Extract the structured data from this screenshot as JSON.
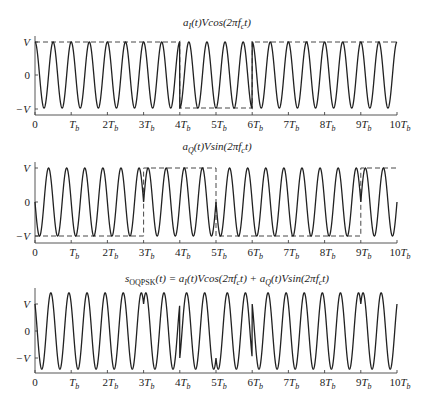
{
  "figure": {
    "panels": [
      {
        "id": "i-channel",
        "title_parts": [
          "a",
          "I",
          "(t)Vcos(2πf",
          "c",
          "t)"
        ],
        "title_text": "a_I(t)Vcos(2πf_c t)",
        "y_labels": [
          "V",
          "0",
          "−V"
        ]
      },
      {
        "id": "q-channel",
        "title_parts": [
          "a",
          "Q",
          "(t)Vsin(2πf",
          "c",
          "t)"
        ],
        "title_text": "a_Q(t)Vsin(2πf_c t)",
        "y_labels": [
          "V",
          "0",
          "−V"
        ]
      },
      {
        "id": "oqpsk-sum",
        "title_parts": [
          "s",
          "OQPSK",
          "(t) = a",
          "I",
          "(t)Vcos(2πf",
          "c",
          "t) + a",
          "Q",
          "(t)Vsin(2πf",
          "c",
          "t)"
        ],
        "title_text": "s_OQPSK(t) = a_I(t)Vcos(2πf_c t) + a_Q(t)Vsin(2πf_c t)",
        "y_labels": [
          "V",
          "0",
          "−V"
        ]
      }
    ],
    "x_tick_labels": [
      {
        "num": "0",
        "sub": ""
      },
      {
        "num": "T",
        "sub": "b",
        "prefix": ""
      },
      {
        "num": "T",
        "sub": "b",
        "prefix": "2"
      },
      {
        "num": "T",
        "sub": "b",
        "prefix": "3"
      },
      {
        "num": "T",
        "sub": "b",
        "prefix": "4"
      },
      {
        "num": "T",
        "sub": "b",
        "prefix": "5"
      },
      {
        "num": "T",
        "sub": "b",
        "prefix": "6"
      },
      {
        "num": "T",
        "sub": "b",
        "prefix": "7"
      },
      {
        "num": "T",
        "sub": "b",
        "prefix": "8"
      },
      {
        "num": "T",
        "sub": "b",
        "prefix": "9"
      },
      {
        "num": "T",
        "sub": "b",
        "prefix": "10"
      }
    ],
    "signal": {
      "carrier_cycles_per_Tb": 2,
      "aI_segments": [
        {
          "from": 0,
          "to": 4,
          "value": 1
        },
        {
          "from": 4,
          "to": 6,
          "value": -1
        },
        {
          "from": 6,
          "to": 10,
          "value": 1
        }
      ],
      "aQ_segments": [
        {
          "from": 0,
          "to": 3,
          "value": -1
        },
        {
          "from": 3,
          "to": 5,
          "value": 1
        },
        {
          "from": 5,
          "to": 9,
          "value": -1
        },
        {
          "from": 9,
          "to": 10,
          "value": 1
        }
      ]
    },
    "colors": {
      "line": "#222222",
      "background": "#ffffff"
    }
  }
}
